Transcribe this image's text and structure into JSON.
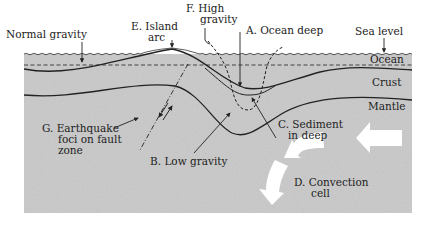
{
  "diagram": {
    "labels": {
      "normal_gravity": "Normal gravity",
      "island_arc_line1": "E. Island",
      "island_arc_line2": "arc",
      "high_gravity_line1": "F. High",
      "high_gravity_line2": "gravity",
      "ocean_deep": "A. Ocean deep",
      "sea_level": "Sea level",
      "ocean": "Ocean",
      "crust": "Crust",
      "mantle": "Mantle",
      "sediment_line1": "C. Sediment",
      "sediment_line2": "in deep",
      "earthquake_line1": "G. Earthquake",
      "earthquake_line2": "foci on fault",
      "earthquake_line3": "zone",
      "low_gravity": "B. Low gravity",
      "convection_line1": "D. Convection",
      "convection_line2": "cell"
    },
    "colors": {
      "background": "#c8c8c8",
      "lines": "#222222",
      "arrows": "#ffffff"
    }
  }
}
